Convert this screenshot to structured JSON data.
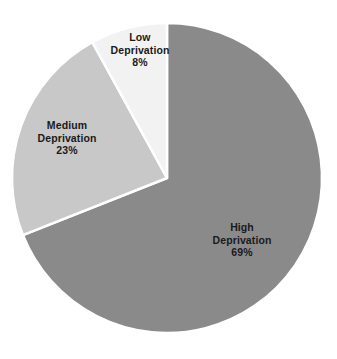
{
  "chart_data": {
    "type": "pie",
    "title": "",
    "subtitle": "",
    "xlabel": "",
    "ylabel": "",
    "legend_position": "none",
    "grid": false,
    "units": "percent",
    "total": 100,
    "start_angle_deg": 0,
    "direction": "clockwise",
    "categories": [
      "High Deprivation",
      "Medium Deprivation",
      "Low Deprivation"
    ],
    "values": [
      69,
      23,
      8
    ],
    "slices": [
      {
        "id": "high",
        "label": "High Deprivation",
        "name_line1": "High",
        "name_line2": "Deprivation",
        "value": 69,
        "value_label": "69%",
        "color": "#8a8a8a",
        "start_angle_deg": 0,
        "end_angle_deg": 248.4,
        "sweep_deg": 248.4,
        "label_x": 242,
        "label_y": 240
      },
      {
        "id": "medium",
        "label": "Medium Deprivation",
        "name_line1": "Medium",
        "name_line2": "Deprivation",
        "value": 23,
        "value_label": "23%",
        "color": "#c8c8c8",
        "start_angle_deg": 248.4,
        "end_angle_deg": 331.2,
        "sweep_deg": 82.8,
        "label_x": 67,
        "label_y": 138
      },
      {
        "id": "low",
        "label": "Low Deprivation",
        "name_line1": "Low",
        "name_line2": "Deprivation",
        "value": 8,
        "value_label": "8%",
        "color": "#f2f2f2",
        "start_angle_deg": 331.2,
        "end_angle_deg": 360,
        "sweep_deg": 28.8,
        "label_x": 140,
        "label_y": 50
      }
    ],
    "geometry": {
      "center_x": 167,
      "center_y": 178,
      "radius": 155
    },
    "style": {
      "background": "#ffffff",
      "separator_color": "#ffffff",
      "separator_width": 2.5,
      "label_color": "#1a1a1a"
    }
  }
}
